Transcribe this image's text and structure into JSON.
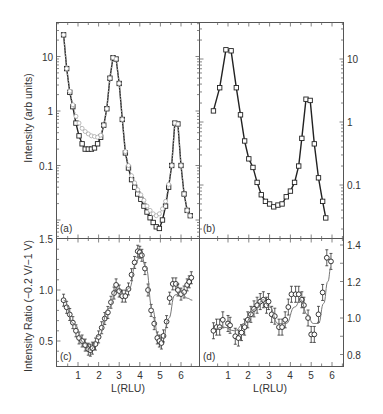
{
  "chart_data": [
    {
      "panel": "(a)",
      "type": "line",
      "yscale": "log",
      "xlabel": "",
      "ylabel": "Intensity (arb units)",
      "ylim": [
        0.005,
        44
      ],
      "xlim": [
        0,
        7
      ],
      "yticks": [
        "10",
        "1",
        "0.1"
      ],
      "series": [
        {
          "name": "-0.2 V (open squares)",
          "x": [
            0.3,
            0.45,
            0.6,
            0.75,
            0.9,
            1.05,
            1.2,
            1.35,
            1.5,
            1.65,
            1.8,
            1.95,
            2.1,
            2.25,
            2.4,
            2.55,
            2.7,
            2.85,
            3.0,
            3.15,
            3.3,
            3.45,
            3.6,
            3.75,
            3.9,
            4.05,
            4.2,
            4.35,
            4.5,
            4.65,
            4.8,
            4.95,
            5.1,
            5.25,
            5.4,
            5.55,
            5.7,
            5.85,
            6.0,
            6.15,
            6.3,
            6.45
          ],
          "values": [
            25,
            6,
            2.2,
            1.2,
            0.6,
            0.35,
            0.25,
            0.2,
            0.2,
            0.2,
            0.21,
            0.25,
            0.33,
            0.55,
            1.1,
            4.0,
            9.5,
            9.0,
            3.2,
            0.7,
            0.17,
            0.09,
            0.055,
            0.04,
            0.03,
            0.024,
            0.018,
            0.014,
            0.011,
            0.009,
            0.0075,
            0.007,
            0.01,
            0.018,
            0.04,
            0.1,
            0.6,
            0.58,
            0.1,
            0.03,
            0.015,
            0.012
          ]
        },
        {
          "name": "-1 V (grey circles)",
          "x": [
            0.3,
            0.45,
            0.6,
            0.75,
            0.9,
            1.05,
            1.2,
            1.35,
            1.5,
            1.65,
            1.8,
            1.95,
            2.1,
            2.25,
            2.4,
            2.55,
            2.7,
            2.85,
            3.0,
            3.15,
            3.3,
            3.45,
            3.6,
            3.75,
            3.9,
            4.05,
            4.2,
            4.35,
            4.5,
            4.65,
            4.8,
            4.95,
            5.1,
            5.25,
            5.4,
            5.55,
            5.7,
            5.85,
            6.0,
            6.15,
            6.3,
            6.45
          ],
          "values": [
            25,
            6,
            2.3,
            1.3,
            0.8,
            0.6,
            0.48,
            0.42,
            0.38,
            0.35,
            0.34,
            0.33,
            0.36,
            0.55,
            1.1,
            4.0,
            9.5,
            9.0,
            3.2,
            0.7,
            0.18,
            0.1,
            0.065,
            0.048,
            0.036,
            0.029,
            0.023,
            0.018,
            0.015,
            0.013,
            0.012,
            0.013,
            0.016,
            0.022,
            0.045,
            0.1,
            0.6,
            0.58,
            0.1,
            0.03,
            0.015,
            0.012
          ]
        }
      ]
    },
    {
      "panel": "(b)",
      "type": "line",
      "yscale": "log",
      "xlabel": "",
      "ylabel": "",
      "ylim": [
        0.02,
        36
      ],
      "xlim": [
        0,
        6.5
      ],
      "yticks": [
        "10",
        "1",
        "0.1"
      ],
      "series": [
        {
          "name": "open squares",
          "x": [
            0.3,
            0.6,
            0.9,
            1.15,
            1.4,
            1.6,
            1.8,
            2.0,
            2.2,
            2.4,
            2.6,
            2.8,
            3.0,
            3.2,
            3.4,
            3.6,
            3.8,
            4.0,
            4.2,
            4.4,
            4.55,
            4.75,
            4.95,
            5.15,
            5.35,
            5.55,
            5.7
          ],
          "values": [
            1.5,
            3.5,
            14,
            13.5,
            3.5,
            1.3,
            0.5,
            0.26,
            0.19,
            0.11,
            0.07,
            0.055,
            0.05,
            0.045,
            0.048,
            0.05,
            0.065,
            0.08,
            0.11,
            0.2,
            0.55,
            2.3,
            2.2,
            0.45,
            0.13,
            0.055,
            0.03
          ]
        }
      ]
    },
    {
      "panel": "(c)",
      "type": "line",
      "yscale": "linear",
      "xlabel": "L(RLU)",
      "ylabel": "Intensity Ratio (−0.2 V/−1 V)",
      "ylim": [
        0.25,
        1.5
      ],
      "xlim": [
        0,
        7
      ],
      "xticks": [
        "1",
        "2",
        "3",
        "4",
        "5",
        "6"
      ],
      "yticks": [
        "1.5",
        "1.0",
        "0.5"
      ],
      "series": [
        {
          "name": "ratio data",
          "x": [
            0.3,
            0.45,
            0.6,
            0.75,
            0.9,
            1.05,
            1.2,
            1.35,
            1.5,
            1.6,
            1.7,
            1.85,
            2.0,
            2.15,
            2.3,
            2.45,
            2.6,
            2.75,
            2.85,
            3.0,
            3.15,
            3.3,
            3.45,
            3.6,
            3.75,
            3.9,
            4.0,
            4.1,
            4.25,
            4.4,
            4.55,
            4.7,
            4.85,
            4.95,
            5.05,
            5.15,
            5.3,
            5.45,
            5.6,
            5.75,
            5.85,
            6.0,
            6.15,
            6.3,
            6.4,
            6.5
          ],
          "values": [
            0.9,
            0.83,
            0.76,
            0.68,
            0.6,
            0.53,
            0.5,
            0.46,
            0.42,
            0.41,
            0.43,
            0.47,
            0.54,
            0.63,
            0.72,
            0.78,
            0.88,
            0.97,
            1.05,
            0.99,
            0.94,
            0.94,
            1.01,
            1.15,
            1.27,
            1.38,
            1.37,
            1.34,
            1.21,
            1.0,
            0.8,
            0.67,
            0.53,
            0.5,
            0.48,
            0.55,
            0.69,
            0.92,
            1.06,
            1.06,
            1.0,
            0.96,
            0.98,
            1.05,
            1.08,
            1.12
          ]
        },
        {
          "name": "model fit (line)",
          "x": [
            0.3,
            0.8,
            1.3,
            1.6,
            2.0,
            2.5,
            2.9,
            3.2,
            3.5,
            3.8,
            4.05,
            4.3,
            4.6,
            4.9,
            5.1,
            5.4,
            5.7,
            6.0,
            6.3,
            6.55
          ],
          "values": [
            0.9,
            0.67,
            0.48,
            0.41,
            0.55,
            0.82,
            1.02,
            0.96,
            1.02,
            1.26,
            1.37,
            1.22,
            0.82,
            0.55,
            0.5,
            0.72,
            0.95,
            0.99,
            0.92,
            0.9
          ]
        }
      ]
    },
    {
      "panel": "(d)",
      "type": "line",
      "yscale": "linear",
      "xlabel": "L(RLU)",
      "ylabel": "",
      "ylim": [
        0.78,
        1.45
      ],
      "xlim": [
        0,
        6.5
      ],
      "xticks": [
        "1",
        "2",
        "3",
        "4",
        "5",
        "6"
      ],
      "yticks": [
        "1.4",
        "1.2",
        "1.0",
        "0.8"
      ],
      "series": [
        {
          "name": "ratio data",
          "x": [
            0.3,
            0.45,
            0.6,
            0.75,
            1.0,
            1.1,
            1.35,
            1.5,
            1.65,
            1.8,
            1.95,
            2.1,
            2.25,
            2.4,
            2.55,
            2.7,
            2.85,
            2.95,
            3.1,
            3.25,
            3.45,
            3.6,
            3.75,
            3.9,
            4.05,
            4.25,
            4.4,
            4.55,
            4.65,
            4.85,
            5.0,
            5.15,
            5.35,
            5.55,
            5.75,
            5.95
          ],
          "values": [
            0.93,
            0.95,
            0.95,
            0.99,
            0.97,
            0.96,
            0.9,
            0.89,
            0.92,
            0.95,
            0.99,
            1.02,
            1.05,
            1.07,
            1.09,
            1.1,
            1.07,
            1.09,
            1.02,
            1.01,
            0.95,
            0.95,
            0.99,
            1.06,
            1.13,
            1.13,
            1.13,
            1.1,
            1.07,
            1.0,
            0.91,
            0.91,
            1.02,
            1.14,
            1.33,
            1.31
          ]
        },
        {
          "name": "model fit (line)",
          "x": [
            0.3,
            0.8,
            1.3,
            1.8,
            2.3,
            2.7,
            3.0,
            3.4,
            3.8,
            4.2,
            4.5,
            4.8,
            5.1,
            5.35,
            5.6,
            5.8,
            5.95
          ],
          "values": [
            0.94,
            0.95,
            0.93,
            0.97,
            1.05,
            1.1,
            1.06,
            0.97,
            0.97,
            1.06,
            1.1,
            1.02,
            0.97,
            0.97,
            1.08,
            1.2,
            1.28
          ]
        }
      ]
    }
  ],
  "panel_labels": [
    "(a)",
    "(b)",
    "(c)",
    "(d)"
  ],
  "axes": {
    "top_left_ylabel": "Intensity (arb units)",
    "bottom_left_ylabel": "Intensity Ratio (−0.2 V/−1 V)",
    "xlabel": "L(RLU)",
    "a_yticks": [
      "10",
      "1",
      "0.1"
    ],
    "b_yticks": [
      "10",
      "1",
      "0.1"
    ],
    "c_yticks": [
      "1.5",
      "1.0",
      "0.5"
    ],
    "d_yticks": [
      "1.4",
      "1.2",
      "1.0",
      "0.8"
    ],
    "xticks": [
      "1",
      "2",
      "3",
      "4",
      "5",
      "6"
    ]
  }
}
